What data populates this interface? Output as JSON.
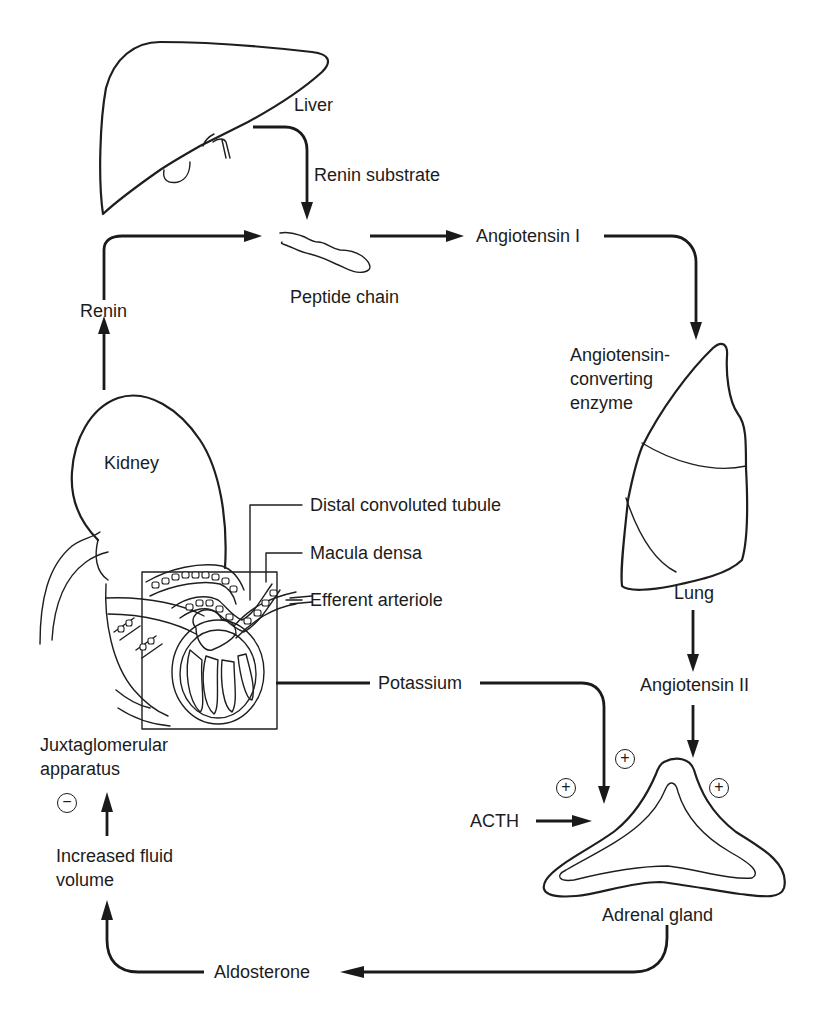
{
  "diagram": {
    "organs": {
      "liver": "Liver",
      "kidney": "Kidney",
      "lung": "Lung",
      "adrenal": "Adrenal gland"
    },
    "labels": {
      "renin_substrate": "Renin substrate",
      "peptide_chain": "Peptide chain",
      "renin": "Renin",
      "angiotensin_i": "Angiotensin I",
      "ace_line1": "Angiotensin-",
      "ace_line2": "converting",
      "ace_line3": "enzyme",
      "angiotensin_ii": "Angiotensin II",
      "potassium": "Potassium",
      "acth": "ACTH",
      "aldosterone": "Aldosterone",
      "fluid_line1": "Increased fluid",
      "fluid_line2": "volume",
      "jga_line1": "Juxtaglomerular",
      "jga_line2": "apparatus"
    },
    "callouts": {
      "dct": "Distal convoluted tubule",
      "macula_densa": "Macula densa",
      "efferent": "Efferent arteriole"
    },
    "signs": {
      "potassium_effect": "+",
      "acth_effect": "+",
      "angiotensin_ii_effect": "+",
      "fluid_volume_effect": "−"
    },
    "flows": [
      {
        "from": "Liver",
        "to": "Peptide chain",
        "label": "Renin substrate"
      },
      {
        "from": "Kidney",
        "to": "Peptide chain",
        "label": "Renin"
      },
      {
        "from": "Peptide chain",
        "to": "Lung",
        "label": "Angiotensin I"
      },
      {
        "from": "Lung",
        "to": "Adrenal gland",
        "label": "Angiotensin II",
        "effect": "+"
      },
      {
        "from": "Kidney",
        "to": "Adrenal gland",
        "label": "Potassium",
        "effect": "+"
      },
      {
        "from": "ACTH",
        "to": "Adrenal gland",
        "effect": "+"
      },
      {
        "from": "Adrenal gland",
        "to": "Increased fluid volume",
        "label": "Aldosterone"
      },
      {
        "from": "Increased fluid volume",
        "to": "Juxtaglomerular apparatus",
        "effect": "−"
      }
    ],
    "colors": {
      "ink": "#1c1c1c",
      "background": "#ffffff"
    }
  }
}
